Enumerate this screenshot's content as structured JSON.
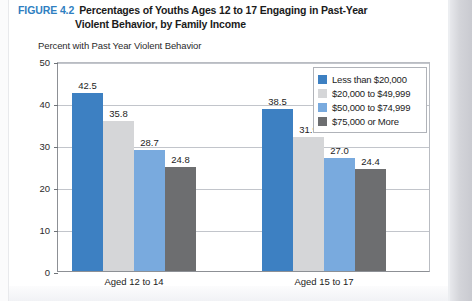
{
  "figure": {
    "number": "FIGURE 4.2",
    "title_line1": "Percentages of Youths Ages 12 to 17 Engaging in Past-Year",
    "title_line2": "Violent Behavior, by Family Income",
    "number_color": "#2f7fc1"
  },
  "chart_data": {
    "type": "bar",
    "title": "Percentages of Youths Ages 12 to 17 Engaging in Past-Year Violent Behavior, by Family Income",
    "subtitle": "Percent with Past Year Violent Behavior",
    "xlabel": "",
    "ylabel": "Percent with Past Year Violent Behavior",
    "ylim": [
      0,
      50
    ],
    "yticks": [
      0,
      10,
      20,
      30,
      40,
      50
    ],
    "ytick_labels": [
      "0",
      "10",
      "20",
      "30",
      "40",
      "50"
    ],
    "grid": true,
    "legend_position": "upper right",
    "categories": [
      "Aged 12 to 14",
      "Aged 15 to 17"
    ],
    "series": [
      {
        "name": "Less than $20,000",
        "color": "#3d80c2",
        "values": [
          42.5,
          38.5
        ],
        "labels": [
          "42.5",
          "38.5"
        ]
      },
      {
        "name": "$20,000 to $49,999",
        "color": "#d5d6d8",
        "values": [
          35.8,
          31.9
        ],
        "labels": [
          "35.8",
          "31.9"
        ]
      },
      {
        "name": "$50,000 to $74,999",
        "color": "#79aade",
        "values": [
          28.7,
          27.0
        ],
        "labels": [
          "28.7",
          "27.0"
        ]
      },
      {
        "name": "$75,000 or More",
        "color": "#6d6e70",
        "values": [
          24.8,
          24.4
        ],
        "labels": [
          "24.8",
          "24.4"
        ]
      }
    ]
  }
}
